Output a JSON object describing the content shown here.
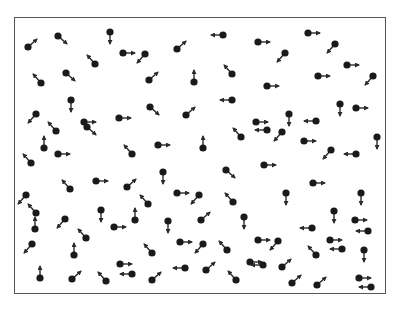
{
  "diagram": {
    "type": "particle-velocity-field",
    "dot_color": "#1a1a1a",
    "arrow_color": "#2a2a2a",
    "frame_color": "#555555",
    "particles": [
      {
        "x": 28,
        "y": 47,
        "dir": "ur"
      },
      {
        "x": 58,
        "y": 36,
        "dir": "dr"
      },
      {
        "x": 110,
        "y": 32,
        "dir": "d"
      },
      {
        "x": 123,
        "y": 53,
        "dir": "r"
      },
      {
        "x": 95,
        "y": 64,
        "dir": "ul"
      },
      {
        "x": 66,
        "y": 73,
        "dir": "dr"
      },
      {
        "x": 41,
        "y": 83,
        "dir": "ul"
      },
      {
        "x": 71,
        "y": 100,
        "dir": "d"
      },
      {
        "x": 145,
        "y": 54,
        "dir": "dl"
      },
      {
        "x": 177,
        "y": 49,
        "dir": "ur"
      },
      {
        "x": 223,
        "y": 35,
        "dir": "l"
      },
      {
        "x": 149,
        "y": 80,
        "dir": "ur"
      },
      {
        "x": 194,
        "y": 82,
        "dir": "u"
      },
      {
        "x": 232,
        "y": 74,
        "dir": "ul"
      },
      {
        "x": 232,
        "y": 100,
        "dir": "l"
      },
      {
        "x": 258,
        "y": 42,
        "dir": "r"
      },
      {
        "x": 308,
        "y": 33,
        "dir": "r"
      },
      {
        "x": 335,
        "y": 44,
        "dir": "dl"
      },
      {
        "x": 285,
        "y": 53,
        "dir": "dl"
      },
      {
        "x": 347,
        "y": 65,
        "dir": "r"
      },
      {
        "x": 318,
        "y": 76,
        "dir": "r"
      },
      {
        "x": 373,
        "y": 76,
        "dir": "dl"
      },
      {
        "x": 267,
        "y": 86,
        "dir": "r"
      },
      {
        "x": 340,
        "y": 104,
        "dir": "d"
      },
      {
        "x": 356,
        "y": 108,
        "dir": "r"
      },
      {
        "x": 36,
        "y": 114,
        "dir": "dl"
      },
      {
        "x": 84,
        "y": 122,
        "dir": "r"
      },
      {
        "x": 119,
        "y": 118,
        "dir": "r"
      },
      {
        "x": 56,
        "y": 131,
        "dir": "ul"
      },
      {
        "x": 44,
        "y": 148,
        "dir": "u"
      },
      {
        "x": 87,
        "y": 127,
        "dir": "dr"
      },
      {
        "x": 58,
        "y": 154,
        "dir": "r"
      },
      {
        "x": 132,
        "y": 154,
        "dir": "ul"
      },
      {
        "x": 31,
        "y": 163,
        "dir": "ul"
      },
      {
        "x": 150,
        "y": 107,
        "dir": "dr"
      },
      {
        "x": 186,
        "y": 115,
        "dir": "ur"
      },
      {
        "x": 158,
        "y": 145,
        "dir": "r"
      },
      {
        "x": 203,
        "y": 148,
        "dir": "u"
      },
      {
        "x": 241,
        "y": 137,
        "dir": "ul"
      },
      {
        "x": 163,
        "y": 172,
        "dir": "d"
      },
      {
        "x": 226,
        "y": 170,
        "dir": "dr"
      },
      {
        "x": 289,
        "y": 114,
        "dir": "d"
      },
      {
        "x": 256,
        "y": 122,
        "dir": "r"
      },
      {
        "x": 316,
        "y": 121,
        "dir": "l"
      },
      {
        "x": 267,
        "y": 130,
        "dir": "l"
      },
      {
        "x": 282,
        "y": 132,
        "dir": "dl"
      },
      {
        "x": 304,
        "y": 141,
        "dir": "r"
      },
      {
        "x": 377,
        "y": 137,
        "dir": "d"
      },
      {
        "x": 331,
        "y": 150,
        "dir": "dl"
      },
      {
        "x": 356,
        "y": 154,
        "dir": "l"
      },
      {
        "x": 264,
        "y": 165,
        "dir": "r"
      },
      {
        "x": 313,
        "y": 183,
        "dir": "r"
      },
      {
        "x": 96,
        "y": 181,
        "dir": "r"
      },
      {
        "x": 70,
        "y": 189,
        "dir": "ul"
      },
      {
        "x": 127,
        "y": 187,
        "dir": "ur"
      },
      {
        "x": 26,
        "y": 195,
        "dir": "dl"
      },
      {
        "x": 36,
        "y": 213,
        "dir": "ul"
      },
      {
        "x": 35,
        "y": 229,
        "dir": "u"
      },
      {
        "x": 65,
        "y": 219,
        "dir": "dl"
      },
      {
        "x": 101,
        "y": 210,
        "dir": "d"
      },
      {
        "x": 114,
        "y": 227,
        "dir": "r"
      },
      {
        "x": 86,
        "y": 238,
        "dir": "ul"
      },
      {
        "x": 32,
        "y": 244,
        "dir": "dl"
      },
      {
        "x": 74,
        "y": 255,
        "dir": "u"
      },
      {
        "x": 120,
        "y": 264,
        "dir": "r"
      },
      {
        "x": 132,
        "y": 274,
        "dir": "l"
      },
      {
        "x": 40,
        "y": 278,
        "dir": "u"
      },
      {
        "x": 72,
        "y": 279,
        "dir": "ur"
      },
      {
        "x": 106,
        "y": 281,
        "dir": "ul"
      },
      {
        "x": 177,
        "y": 193,
        "dir": "r"
      },
      {
        "x": 199,
        "y": 195,
        "dir": "dl"
      },
      {
        "x": 148,
        "y": 204,
        "dir": "ul"
      },
      {
        "x": 233,
        "y": 202,
        "dir": "ul"
      },
      {
        "x": 135,
        "y": 220,
        "dir": "u"
      },
      {
        "x": 168,
        "y": 221,
        "dir": "d"
      },
      {
        "x": 201,
        "y": 220,
        "dir": "ur"
      },
      {
        "x": 244,
        "y": 217,
        "dir": "d"
      },
      {
        "x": 180,
        "y": 242,
        "dir": "r"
      },
      {
        "x": 203,
        "y": 244,
        "dir": "dl"
      },
      {
        "x": 152,
        "y": 253,
        "dir": "ul"
      },
      {
        "x": 227,
        "y": 250,
        "dir": "ul"
      },
      {
        "x": 185,
        "y": 268,
        "dir": "l"
      },
      {
        "x": 206,
        "y": 270,
        "dir": "ur"
      },
      {
        "x": 250,
        "y": 262,
        "dir": "r"
      },
      {
        "x": 152,
        "y": 280,
        "dir": "ur"
      },
      {
        "x": 236,
        "y": 280,
        "dir": "ul"
      },
      {
        "x": 286,
        "y": 193,
        "dir": "d"
      },
      {
        "x": 361,
        "y": 193,
        "dir": "d"
      },
      {
        "x": 334,
        "y": 211,
        "dir": "d"
      },
      {
        "x": 355,
        "y": 220,
        "dir": "r"
      },
      {
        "x": 312,
        "y": 228,
        "dir": "l"
      },
      {
        "x": 368,
        "y": 231,
        "dir": "l"
      },
      {
        "x": 258,
        "y": 240,
        "dir": "r"
      },
      {
        "x": 278,
        "y": 241,
        "dir": "dl"
      },
      {
        "x": 330,
        "y": 240,
        "dir": "r"
      },
      {
        "x": 342,
        "y": 249,
        "dir": "l"
      },
      {
        "x": 316,
        "y": 255,
        "dir": "ul"
      },
      {
        "x": 364,
        "y": 250,
        "dir": "d"
      },
      {
        "x": 263,
        "y": 265,
        "dir": "l"
      },
      {
        "x": 282,
        "y": 267,
        "dir": "ur"
      },
      {
        "x": 292,
        "y": 283,
        "dir": "ur"
      },
      {
        "x": 317,
        "y": 285,
        "dir": "ur"
      },
      {
        "x": 359,
        "y": 278,
        "dir": "r"
      },
      {
        "x": 371,
        "y": 287,
        "dir": "l"
      }
    ]
  }
}
